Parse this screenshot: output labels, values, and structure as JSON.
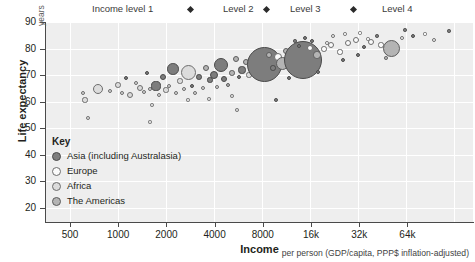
{
  "header": {
    "levels": [
      {
        "label": "Income level 1",
        "x": 92
      },
      {
        "label": "Level 2",
        "x": 223
      },
      {
        "label": "Level 3",
        "x": 290
      },
      {
        "label": "Level 4",
        "x": 382
      }
    ],
    "diamonds": [
      188,
      264,
      351
    ]
  },
  "axes": {
    "y_title": "Life expectancy",
    "y_unit": "years",
    "x_title": "Income",
    "y_ticks": [
      "90",
      "80",
      "70",
      "60",
      "50",
      "40",
      "30",
      "20"
    ],
    "x_ticks": [
      "500",
      "1000",
      "2000",
      "4000",
      "8000",
      "16k",
      "32k",
      "64k"
    ]
  },
  "caption": "per person (GDP/capita, PPP$ inflation-adjusted)",
  "key": {
    "title": "Key",
    "items": [
      {
        "label": "Asia (including Australasia)",
        "fill": "#7d7d7d",
        "stroke": "#4a4a4a"
      },
      {
        "label": "Europe",
        "fill": "#fbfbfb",
        "stroke": "#6d6d6d"
      },
      {
        "label": "Africa",
        "fill": "#dcdcdc",
        "stroke": "#6d6d6d"
      },
      {
        "label": "The Americas",
        "fill": "#b4b4b4",
        "stroke": "#5c5c5c"
      }
    ]
  },
  "chart_data": {
    "type": "scatter",
    "title": "",
    "xlabel": "Income",
    "ylabel": "Life expectancy",
    "xscale": "log",
    "xlim": [
      350,
      95000
    ],
    "ylim": [
      18,
      92
    ],
    "xtick_values": [
      500,
      1000,
      2000,
      4000,
      8000,
      16000,
      32000,
      64000
    ],
    "ytick_values": [
      20,
      30,
      40,
      50,
      60,
      70,
      80,
      90
    ],
    "grid": true,
    "legend_position": "inside-lower-left",
    "bubble_encoding": "population",
    "color_encoding": "region",
    "series": [
      {
        "name": "Asia (including Australasia)",
        "color": "#7d7d7d"
      },
      {
        "name": "Europe",
        "color": "#fbfbfb"
      },
      {
        "name": "Africa",
        "color": "#dcdcdc"
      },
      {
        "name": "The Americas",
        "color": "#b4b4b4"
      }
    ],
    "points": [
      {
        "income": 640,
        "life": 62.5,
        "r": 2.4,
        "region": "Africa"
      },
      {
        "income": 660,
        "life": 59.8,
        "r": 2.6,
        "region": "Africa"
      },
      {
        "income": 700,
        "life": 53.0,
        "r": 1.9,
        "region": "Africa"
      },
      {
        "income": 760,
        "life": 64.0,
        "r": 5.2,
        "region": "Africa"
      },
      {
        "income": 880,
        "life": 63.2,
        "r": 2.3,
        "region": "Africa"
      },
      {
        "income": 1020,
        "life": 65.5,
        "r": 2.8,
        "region": "Africa"
      },
      {
        "income": 1060,
        "life": 63.0,
        "r": 2.0,
        "region": "Africa"
      },
      {
        "income": 1130,
        "life": 66.0,
        "r": 2.0,
        "region": "Asia"
      },
      {
        "income": 1180,
        "life": 62.0,
        "r": 3.0,
        "region": "Africa"
      },
      {
        "income": 1300,
        "life": 66.5,
        "r": 2.4,
        "region": "Africa"
      },
      {
        "income": 1380,
        "life": 64.6,
        "r": 3.0,
        "region": "Africa"
      },
      {
        "income": 1440,
        "life": 62.8,
        "r": 2.2,
        "region": "Africa"
      },
      {
        "income": 1500,
        "life": 70.0,
        "r": 2.1,
        "region": "Asia"
      },
      {
        "income": 1560,
        "life": 64.0,
        "r": 2.1,
        "region": "Africa"
      },
      {
        "income": 1600,
        "life": 58.0,
        "r": 1.7,
        "region": "Africa"
      },
      {
        "income": 1680,
        "life": 66.0,
        "r": 4.6,
        "region": "Asia"
      },
      {
        "income": 1700,
        "life": 62.0,
        "r": 2.3,
        "region": "Africa"
      },
      {
        "income": 1790,
        "life": 68.5,
        "r": 3.4,
        "region": "Asia"
      },
      {
        "income": 1860,
        "life": 63.6,
        "r": 2.6,
        "region": "Africa"
      },
      {
        "income": 1900,
        "life": 65.2,
        "r": 2.0,
        "region": "Africa"
      },
      {
        "income": 1980,
        "life": 71.5,
        "r": 5.8,
        "region": "Asia"
      },
      {
        "income": 2050,
        "life": 62.5,
        "r": 2.2,
        "region": "Africa"
      },
      {
        "income": 2150,
        "life": 67.0,
        "r": 2.6,
        "region": "Africa"
      },
      {
        "income": 2250,
        "life": 64.0,
        "r": 2.0,
        "region": "Africa"
      },
      {
        "income": 2400,
        "life": 70.5,
        "r": 7.5,
        "region": "Africa"
      },
      {
        "income": 2500,
        "life": 66.0,
        "r": 2.4,
        "region": "Asia"
      },
      {
        "income": 2600,
        "life": 63.0,
        "r": 2.1,
        "region": "Africa"
      },
      {
        "income": 2700,
        "life": 68.5,
        "r": 2.8,
        "region": "Asia"
      },
      {
        "income": 2900,
        "life": 65.0,
        "r": 2.0,
        "region": "Africa"
      },
      {
        "income": 3000,
        "life": 72.0,
        "r": 3.0,
        "region": "Americas"
      },
      {
        "income": 3200,
        "life": 67.5,
        "r": 2.6,
        "region": "Asia"
      },
      {
        "income": 3400,
        "life": 69.5,
        "r": 4.0,
        "region": "Asia"
      },
      {
        "income": 3600,
        "life": 64.5,
        "r": 2.0,
        "region": "Africa"
      },
      {
        "income": 3800,
        "life": 73.0,
        "r": 7.0,
        "region": "Asia"
      },
      {
        "income": 3900,
        "life": 68.0,
        "r": 3.2,
        "region": "Asia"
      },
      {
        "income": 4100,
        "life": 66.0,
        "r": 2.4,
        "region": "Americas"
      },
      {
        "income": 4300,
        "life": 70.5,
        "r": 2.8,
        "region": "Americas"
      },
      {
        "income": 4600,
        "life": 76.0,
        "r": 3.4,
        "region": "Americas"
      },
      {
        "income": 4800,
        "life": 68.5,
        "r": 2.2,
        "region": "Asia"
      },
      {
        "income": 5000,
        "life": 71.0,
        "r": 3.6,
        "region": "Asia"
      },
      {
        "income": 5300,
        "life": 74.0,
        "r": 3.0,
        "region": "Americas"
      },
      {
        "income": 5600,
        "life": 69.0,
        "r": 2.6,
        "region": "Africa"
      },
      {
        "income": 6000,
        "life": 72.5,
        "r": 4.2,
        "region": "Asia"
      },
      {
        "income": 6400,
        "life": 75.0,
        "r": 3.0,
        "region": "Americas"
      },
      {
        "income": 6800,
        "life": 70.0,
        "r": 2.4,
        "region": "Americas"
      },
      {
        "income": 7200,
        "life": 73.0,
        "r": 17.5,
        "region": "Asia"
      },
      {
        "income": 7600,
        "life": 77.0,
        "r": 3.2,
        "region": "Americas"
      },
      {
        "income": 8200,
        "life": 71.5,
        "r": 2.8,
        "region": "Asia"
      },
      {
        "income": 8800,
        "life": 75.5,
        "r": 4.0,
        "region": "Europe"
      },
      {
        "income": 9400,
        "life": 74.0,
        "r": 6.5,
        "region": "Americas"
      },
      {
        "income": 10000,
        "life": 78.0,
        "r": 3.0,
        "region": "Americas"
      },
      {
        "income": 11000,
        "life": 72.0,
        "r": 2.6,
        "region": "Europe"
      },
      {
        "income": 12000,
        "life": 76.5,
        "r": 3.4,
        "region": "Americas"
      },
      {
        "income": 13000,
        "life": 74.5,
        "r": 19.0,
        "region": "Asia"
      },
      {
        "income": 14500,
        "life": 79.0,
        "r": 3.0,
        "region": "Europe"
      },
      {
        "income": 16000,
        "life": 76.0,
        "r": 3.6,
        "region": "Americas"
      },
      {
        "income": 18000,
        "life": 78.5,
        "r": 2.8,
        "region": "Europe"
      },
      {
        "income": 20000,
        "life": 80.0,
        "r": 3.2,
        "region": "Europe"
      },
      {
        "income": 23000,
        "life": 77.5,
        "r": 2.6,
        "region": "Europe"
      },
      {
        "income": 26000,
        "life": 81.0,
        "r": 3.0,
        "region": "Europe"
      },
      {
        "income": 30000,
        "life": 82.0,
        "r": 3.4,
        "region": "Europe"
      },
      {
        "income": 34000,
        "life": 79.5,
        "r": 2.4,
        "region": "Asia"
      },
      {
        "income": 38000,
        "life": 81.5,
        "r": 3.0,
        "region": "Europe"
      },
      {
        "income": 44000,
        "life": 80.0,
        "r": 2.6,
        "region": "Europe"
      },
      {
        "income": 48000,
        "life": 79.0,
        "r": 8.5,
        "region": "Americas"
      },
      {
        "income": 55000,
        "life": 82.5,
        "r": 2.2,
        "region": "Europe"
      },
      {
        "income": 64000,
        "life": 83.0,
        "r": 2.4,
        "region": "Asia"
      },
      {
        "income": 80000,
        "life": 82.0,
        "r": 2.0,
        "region": "Europe"
      }
    ]
  },
  "bubbles": [
    {
      "cx": 83,
      "cy": 93,
      "r": 2.4,
      "g": "af"
    },
    {
      "cx": 85,
      "cy": 100,
      "r": 2.6,
      "g": "af"
    },
    {
      "cx": 88,
      "cy": 118,
      "r": 1.9,
      "g": "af"
    },
    {
      "cx": 98,
      "cy": 89,
      "r": 5.2,
      "g": "af"
    },
    {
      "cx": 110,
      "cy": 91,
      "r": 2.3,
      "g": "af"
    },
    {
      "cx": 118,
      "cy": 85,
      "r": 2.8,
      "g": "af"
    },
    {
      "cx": 122,
      "cy": 93,
      "r": 2.0,
      "g": "af"
    },
    {
      "cx": 126,
      "cy": 78,
      "r": 2.0,
      "g": "as"
    },
    {
      "cx": 130,
      "cy": 95,
      "r": 3.0,
      "g": "af"
    },
    {
      "cx": 136,
      "cy": 83,
      "r": 2.4,
      "g": "af"
    },
    {
      "cx": 140,
      "cy": 88,
      "r": 3.0,
      "g": "af"
    },
    {
      "cx": 144,
      "cy": 92,
      "r": 2.2,
      "g": "af"
    },
    {
      "cx": 147,
      "cy": 73,
      "r": 2.1,
      "g": "as"
    },
    {
      "cx": 150,
      "cy": 89,
      "r": 2.1,
      "g": "af"
    },
    {
      "cx": 152,
      "cy": 105,
      "r": 1.7,
      "g": "af"
    },
    {
      "cx": 156,
      "cy": 86,
      "r": 4.6,
      "g": "as"
    },
    {
      "cx": 159,
      "cy": 95,
      "r": 2.3,
      "g": "af"
    },
    {
      "cx": 163,
      "cy": 77,
      "r": 3.4,
      "g": "as"
    },
    {
      "cx": 166,
      "cy": 90,
      "r": 2.6,
      "g": "af"
    },
    {
      "cx": 169,
      "cy": 86,
      "r": 2.0,
      "g": "af"
    },
    {
      "cx": 173,
      "cy": 69,
      "r": 5.8,
      "g": "as"
    },
    {
      "cx": 176,
      "cy": 93,
      "r": 2.2,
      "g": "af"
    },
    {
      "cx": 180,
      "cy": 81,
      "r": 2.6,
      "g": "af"
    },
    {
      "cx": 184,
      "cy": 89,
      "r": 2.0,
      "g": "af"
    },
    {
      "cx": 188,
      "cy": 72,
      "r": 7.5,
      "g": "af"
    },
    {
      "cx": 192,
      "cy": 86,
      "r": 2.4,
      "g": "as"
    },
    {
      "cx": 195,
      "cy": 93,
      "r": 2.1,
      "g": "af"
    },
    {
      "cx": 199,
      "cy": 77,
      "r": 2.8,
      "g": "as"
    },
    {
      "cx": 203,
      "cy": 88,
      "r": 2.0,
      "g": "af"
    },
    {
      "cx": 206,
      "cy": 68,
      "r": 3.0,
      "g": "am"
    },
    {
      "cx": 210,
      "cy": 80,
      "r": 2.6,
      "g": "as"
    },
    {
      "cx": 214,
      "cy": 75,
      "r": 4.0,
      "g": "as"
    },
    {
      "cx": 217,
      "cy": 87,
      "r": 2.0,
      "g": "af"
    },
    {
      "cx": 221,
      "cy": 65,
      "r": 7.0,
      "g": "as"
    },
    {
      "cx": 224,
      "cy": 79,
      "r": 3.2,
      "g": "as"
    },
    {
      "cx": 228,
      "cy": 85,
      "r": 2.4,
      "g": "am"
    },
    {
      "cx": 232,
      "cy": 73,
      "r": 2.8,
      "g": "am"
    },
    {
      "cx": 236,
      "cy": 59,
      "r": 3.4,
      "g": "am"
    },
    {
      "cx": 239,
      "cy": 77,
      "r": 2.2,
      "g": "as"
    },
    {
      "cx": 242,
      "cy": 70,
      "r": 3.6,
      "g": "as"
    },
    {
      "cx": 246,
      "cy": 62,
      "r": 3.0,
      "g": "am"
    },
    {
      "cx": 249,
      "cy": 75,
      "r": 2.6,
      "g": "af"
    },
    {
      "cx": 253,
      "cy": 66,
      "r": 4.2,
      "g": "as"
    },
    {
      "cx": 257,
      "cy": 59,
      "r": 3.0,
      "g": "am"
    },
    {
      "cx": 260,
      "cy": 72,
      "r": 2.4,
      "g": "am"
    },
    {
      "cx": 264,
      "cy": 64,
      "r": 17.5,
      "g": "as"
    },
    {
      "cx": 269,
      "cy": 55,
      "r": 3.2,
      "g": "am"
    },
    {
      "cx": 273,
      "cy": 68,
      "r": 2.8,
      "g": "as"
    },
    {
      "cx": 278,
      "cy": 57,
      "r": 4.0,
      "g": "eu"
    },
    {
      "cx": 282,
      "cy": 63,
      "r": 6.5,
      "g": "am"
    },
    {
      "cx": 286,
      "cy": 51,
      "r": 3.0,
      "g": "am"
    },
    {
      "cx": 291,
      "cy": 67,
      "r": 2.6,
      "g": "eu"
    },
    {
      "cx": 296,
      "cy": 55,
      "r": 3.4,
      "g": "am"
    },
    {
      "cx": 303,
      "cy": 60,
      "r": 19.0,
      "g": "as"
    },
    {
      "cx": 310,
      "cy": 48,
      "r": 3.0,
      "g": "eu"
    },
    {
      "cx": 317,
      "cy": 55,
      "r": 3.6,
      "g": "am"
    },
    {
      "cx": 324,
      "cy": 49,
      "r": 2.8,
      "g": "eu"
    },
    {
      "cx": 331,
      "cy": 45,
      "r": 3.2,
      "g": "eu"
    },
    {
      "cx": 340,
      "cy": 52,
      "r": 2.6,
      "g": "eu"
    },
    {
      "cx": 348,
      "cy": 43,
      "r": 3.0,
      "g": "eu"
    },
    {
      "cx": 356,
      "cy": 40,
      "r": 3.4,
      "g": "eu"
    },
    {
      "cx": 364,
      "cy": 47,
      "r": 2.4,
      "g": "as"
    },
    {
      "cx": 371,
      "cy": 42,
      "r": 3.0,
      "g": "eu"
    },
    {
      "cx": 381,
      "cy": 45,
      "r": 2.6,
      "g": "eu"
    },
    {
      "cx": 391,
      "cy": 48,
      "r": 8.5,
      "g": "am"
    },
    {
      "cx": 402,
      "cy": 38,
      "r": 2.2,
      "g": "eu"
    },
    {
      "cx": 413,
      "cy": 36,
      "r": 2.4,
      "g": "as"
    },
    {
      "cx": 434,
      "cy": 40,
      "r": 2.0,
      "g": "eu"
    },
    {
      "cx": 305,
      "cy": 38,
      "r": 2.0,
      "g": "as"
    },
    {
      "cx": 295,
      "cy": 41,
      "r": 1.8,
      "g": "as"
    },
    {
      "cx": 333,
      "cy": 36,
      "r": 2.2,
      "g": "eu"
    },
    {
      "cx": 345,
      "cy": 34,
      "r": 1.8,
      "g": "eu"
    },
    {
      "cx": 360,
      "cy": 33,
      "r": 1.6,
      "g": "eu"
    },
    {
      "cx": 377,
      "cy": 36,
      "r": 1.8,
      "g": "as"
    },
    {
      "cx": 405,
      "cy": 30,
      "r": 1.7,
      "g": "as"
    },
    {
      "cx": 425,
      "cy": 34,
      "r": 1.6,
      "g": "eu"
    },
    {
      "cx": 449,
      "cy": 31,
      "r": 1.7,
      "g": "as"
    },
    {
      "cx": 150,
      "cy": 122,
      "r": 1.6,
      "g": "af"
    },
    {
      "cx": 237,
      "cy": 110,
      "r": 1.8,
      "g": "af"
    },
    {
      "cx": 276,
      "cy": 100,
      "r": 1.9,
      "g": "as"
    },
    {
      "cx": 318,
      "cy": 72,
      "r": 2.0,
      "g": "as"
    },
    {
      "cx": 343,
      "cy": 60,
      "r": 2.2,
      "g": "as"
    },
    {
      "cx": 289,
      "cy": 78,
      "r": 2.0,
      "g": "as"
    },
    {
      "cx": 232,
      "cy": 96,
      "r": 1.8,
      "g": "af"
    },
    {
      "cx": 209,
      "cy": 99,
      "r": 1.7,
      "g": "af"
    },
    {
      "cx": 188,
      "cy": 100,
      "r": 1.6,
      "g": "af"
    },
    {
      "cx": 358,
      "cy": 55,
      "r": 2.0,
      "g": "as"
    },
    {
      "cx": 386,
      "cy": 58,
      "r": 1.8,
      "g": "am"
    },
    {
      "cx": 299,
      "cy": 46,
      "r": 2.4,
      "g": "as"
    },
    {
      "cx": 312,
      "cy": 41,
      "r": 2.0,
      "g": "as"
    },
    {
      "cx": 327,
      "cy": 43,
      "r": 1.9,
      "g": "eu"
    },
    {
      "cx": 368,
      "cy": 39,
      "r": 1.7,
      "g": "eu"
    }
  ],
  "bubble_styles": {
    "as": {
      "fill": "#7d7d7d",
      "stroke": "#4a4a4a"
    },
    "eu": {
      "fill": "#fbfbfb",
      "stroke": "#6d6d6d"
    },
    "af": {
      "fill": "#dcdcdc",
      "stroke": "#6d6d6d"
    },
    "am": {
      "fill": "#b4b4b4",
      "stroke": "#5c5c5c"
    }
  },
  "gridlines": {
    "v": [
      24,
      72,
      120,
      168,
      216,
      264,
      312,
      360,
      408
    ],
    "h": [
      0,
      26.5,
      53,
      79.5,
      106,
      132.5,
      159,
      185.5
    ]
  }
}
